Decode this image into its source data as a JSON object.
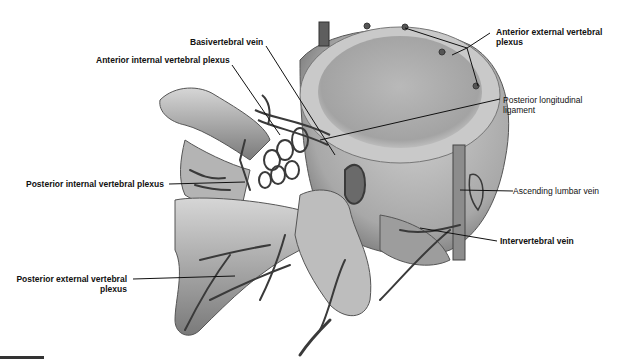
{
  "figure": {
    "labels": [
      {
        "id": "basivertebral",
        "text": "Basivertebral vein",
        "bold": true
      },
      {
        "id": "anterior-internal",
        "text": "Anterior internal vertebral plexus",
        "bold": true
      },
      {
        "id": "anterior-external",
        "line1": "Anterior external vertebral",
        "line2": "plexus",
        "bold": true
      },
      {
        "id": "posterior-longitudinal",
        "line1": "Posterior longitudinal",
        "line2": "ligament",
        "bold": false
      },
      {
        "id": "posterior-internal",
        "text": "Posterior internal vertebral plexus",
        "bold": true
      },
      {
        "id": "ascending-lumbar",
        "text": "Ascending lumbar vein",
        "bold": false
      },
      {
        "id": "intervertebral",
        "text": "Intervertebral vein",
        "bold": true
      },
      {
        "id": "posterior-external",
        "line1": "Posterior external vertebral",
        "line2": "plexus",
        "bold": true
      }
    ],
    "colors": {
      "bone_light": "#d8d8d8",
      "bone_mid": "#a9a9a9",
      "bone_dark": "#6e6e6e",
      "vein": "#3a3a3a",
      "leader": "#111111"
    }
  }
}
